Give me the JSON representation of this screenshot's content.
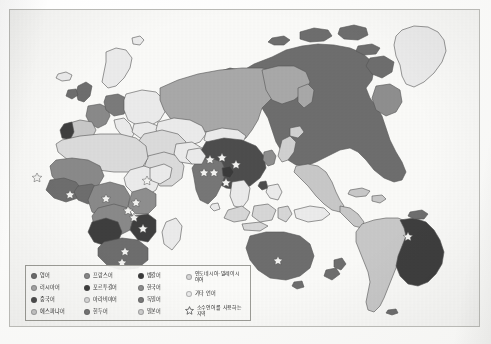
{
  "map": {
    "title": "세계의 언어 분포 지도",
    "projection": "world",
    "background_color": "#fdfdfc",
    "border_color": "#b9b9b5",
    "ocean_color": "#fbfbf9",
    "coastline_color": "#5a5a5a",
    "star_marker_label": "소수언어 지역 표시",
    "star_marker_color": "#f2f2f0"
  },
  "legend": {
    "border_color": "#9e9e98",
    "background_color": "#fcfcfa",
    "columns": [
      {
        "items": [
          {
            "label": "영어",
            "color": "#6e6e6e"
          },
          {
            "label": "러시아어",
            "color": "#a9a9a9"
          },
          {
            "label": "중국어",
            "color": "#4d4d4d"
          },
          {
            "label": "에스파냐어",
            "color": "#c9c9c9"
          }
        ]
      },
      {
        "items": [
          {
            "label": "프랑스어",
            "color": "#8a8a8a"
          },
          {
            "label": "포르투갈어",
            "color": "#3e3e3e"
          },
          {
            "label": "아라비아어",
            "color": "#dcdcdc"
          },
          {
            "label": "힌두어",
            "color": "#777777"
          }
        ]
      },
      {
        "items": [
          {
            "label": "벵갈어",
            "color": "#3a3a3a"
          },
          {
            "label": "한국어",
            "color": "#8f8f8f"
          },
          {
            "label": "독일어",
            "color": "#7b7b7b"
          },
          {
            "label": "일본어",
            "color": "#d2d2d2"
          }
        ]
      },
      {
        "items": [
          {
            "label": "인도네시아·말레이시아어",
            "color": "#d8d8d8",
            "multiline": true
          },
          {
            "label": "기타 언어",
            "color": "#ececec"
          },
          {
            "label": "소수언어를 사용하는 지역",
            "marker": "star",
            "multiline": true
          }
        ]
      }
    ]
  },
  "regions": {
    "english": "#6e6e6e",
    "russian": "#a9a9a9",
    "chinese": "#4d4d4d",
    "spanish": "#c9c9c9",
    "french": "#8a8a8a",
    "portuguese": "#3e3e3e",
    "arabic": "#dcdcdc",
    "hindi": "#777777",
    "bengali": "#3a3a3a",
    "korean": "#8f8f8f",
    "german": "#7b7b7b",
    "japanese": "#d2d2d2",
    "indonesian": "#d8d8d8",
    "other": "#ececec"
  }
}
